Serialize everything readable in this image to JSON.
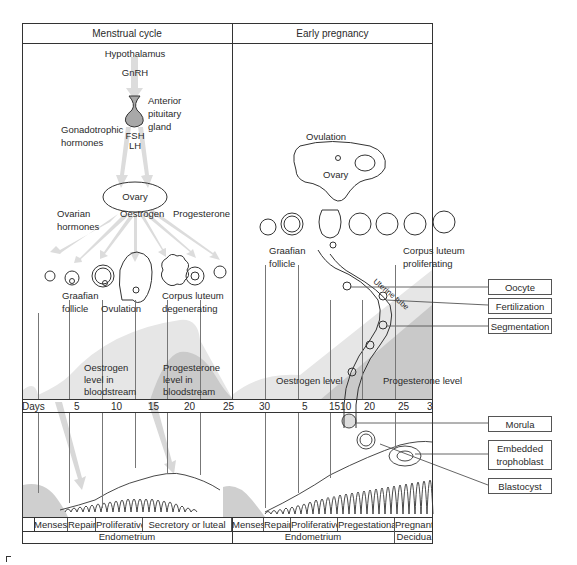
{
  "header": {
    "left_title": "Menstrual cycle",
    "right_title": "Early pregnancy"
  },
  "menstrual": {
    "hypothalamus": "Hypothalamus",
    "gnrh": "GnRH",
    "anterior_pituitary": [
      "Anterior",
      "pituitary",
      "gland"
    ],
    "gonadotrophic": [
      "Gonadotrophic",
      "hormones"
    ],
    "fsh": "FSH",
    "lh": "LH",
    "ovary": "Ovary",
    "ovarian_hormones": [
      "Ovarian",
      "hormones"
    ],
    "oestrogen": "Oestrogen",
    "progesterone": "Progesterone",
    "graafian": [
      "Graafian",
      "follicle"
    ],
    "ovulation": "Ovulation",
    "corpus_luteum": [
      "Corpus luteum",
      "degenerating"
    ],
    "oestrogen_level": [
      "Oestrogen",
      "level in",
      "bloodstream"
    ],
    "progesterone_level": [
      "Progesterone",
      "level in",
      "bloodstream"
    ]
  },
  "pregnancy": {
    "ovulation": "Ovulation",
    "ovary": "Ovary",
    "graafian": [
      "Graafian",
      "follicle"
    ],
    "corpus_luteum": [
      "Corpus luteum",
      "proliferating"
    ],
    "uterine_tube": "Uterine tube",
    "oestrogen_level": "Oestrogen level",
    "progesterone_level": "Progesterone level"
  },
  "days_axis": {
    "label": "Days",
    "ticks": [
      "5",
      "10",
      "15",
      "20",
      "25",
      "30",
      "5",
      "1510",
      "20",
      "25",
      "30",
      "5",
      "3"
    ]
  },
  "phases": {
    "row": [
      "Menses",
      "Repair",
      "Proliferative",
      "Secretory or luteal",
      "Menses",
      "Repair",
      "Proliferative",
      "Pregestational",
      "Pregnant"
    ],
    "tissue": [
      "Endometrium",
      "Endometrium",
      "Decidua"
    ]
  },
  "callouts": {
    "oocyte": "Oocyte",
    "fertilization": "Fertilization",
    "segmentation": "Segmentation",
    "morula": "Morula",
    "embedded_trophoblast": [
      "Embedded",
      "trophoblast"
    ],
    "blastocyst": "Blastocyst"
  },
  "colors": {
    "frame": "#333333",
    "oestrogen_fill": "#e4e4e4",
    "progesterone_fill": "#c9c9c9",
    "arrow_fill": "#dcdcdc",
    "pituitary_fill": "#a8a8a8"
  }
}
